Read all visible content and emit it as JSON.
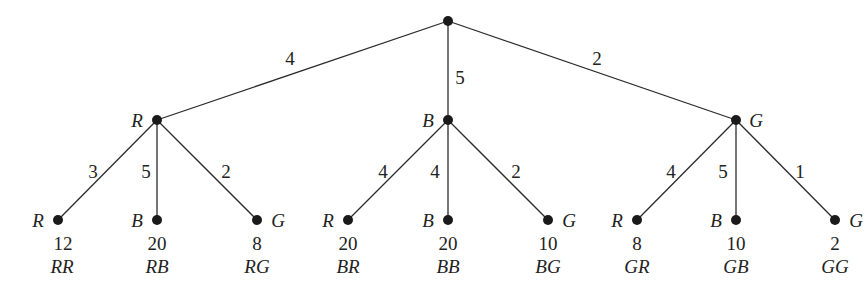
{
  "diagram": {
    "type": "probability-tree",
    "root": {
      "x": 448,
      "y": 21
    },
    "level1": [
      {
        "label": "R",
        "weight": "4",
        "x": 157,
        "y": 120,
        "label_side": "left",
        "weight_pos": [
          290,
          58
        ],
        "children": [
          {
            "label": "R",
            "weight": "3",
            "value": "12",
            "code": "RR",
            "x": 58,
            "label_side": "left",
            "weight_pos": [
              93,
              172
            ]
          },
          {
            "label": "B",
            "weight": "5",
            "value": "20",
            "code": "RB",
            "x": 157,
            "label_side": "left",
            "weight_pos": [
              146,
              172
            ]
          },
          {
            "label": "G",
            "weight": "2",
            "value": "8",
            "code": "RG",
            "x": 257,
            "label_side": "right",
            "weight_pos": [
              226,
              172
            ]
          }
        ]
      },
      {
        "label": "B",
        "weight": "5",
        "x": 448,
        "y": 120,
        "label_side": "left",
        "weight_pos": [
          460,
          77
        ],
        "children": [
          {
            "label": "R",
            "weight": "4",
            "value": "20",
            "code": "BR",
            "x": 348,
            "label_side": "left",
            "weight_pos": [
              383,
              172
            ]
          },
          {
            "label": "B",
            "weight": "4",
            "value": "20",
            "code": "BB",
            "x": 448,
            "label_side": "left",
            "weight_pos": [
              435,
              172
            ]
          },
          {
            "label": "G",
            "weight": "2",
            "value": "10",
            "code": "BG",
            "x": 548,
            "label_side": "right",
            "weight_pos": [
              516,
              172
            ]
          }
        ]
      },
      {
        "label": "G",
        "weight": "2",
        "x": 736,
        "y": 120,
        "label_side": "right",
        "weight_pos": [
          597,
          65
        ],
        "children": [
          {
            "label": "R",
            "weight": "4",
            "value": "8",
            "code": "GR",
            "x": 637,
            "label_side": "left",
            "weight_pos": [
              671,
              172
            ]
          },
          {
            "label": "B",
            "weight": "5",
            "value": "10",
            "code": "GB",
            "x": 736,
            "label_side": "left",
            "weight_pos": [
              723,
              172
            ]
          },
          {
            "label": "G",
            "weight": "1",
            "value": "2",
            "code": "GG",
            "x": 835,
            "label_side": "right",
            "weight_pos": [
              800,
              172
            ]
          }
        ]
      }
    ],
    "leaf_y": 220
  }
}
